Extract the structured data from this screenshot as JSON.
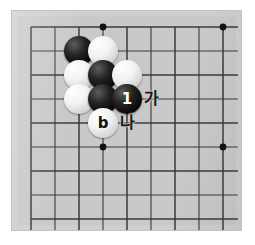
{
  "diagram": {
    "kind": "go-board-diagram",
    "board": {
      "background_color": "#c9c9c9",
      "frame_color": "#cfcfcf",
      "line_color": "#3a3a3a",
      "columns": 9,
      "rows": 9,
      "origin_x": 19,
      "origin_y": 16,
      "spacing": 24,
      "star_points": [
        {
          "col": 3,
          "row": 0
        },
        {
          "col": 8,
          "row": 0
        },
        {
          "col": 3,
          "row": 5
        },
        {
          "col": 8,
          "row": 5
        }
      ]
    },
    "stones": [
      {
        "id": "black-upper-left",
        "color": "black",
        "label": "",
        "col": 2,
        "row": 1
      },
      {
        "id": "white-upper-right",
        "color": "white",
        "label": "",
        "col": 3,
        "row": 1
      },
      {
        "id": "white-left-middle",
        "color": "white",
        "label": "",
        "col": 2,
        "row": 2
      },
      {
        "id": "black-center",
        "color": "black",
        "label": "",
        "col": 3,
        "row": 2
      },
      {
        "id": "white-right-middle",
        "color": "white",
        "label": "",
        "col": 4,
        "row": 2
      },
      {
        "id": "white-left-lower",
        "color": "white",
        "label": "",
        "col": 2,
        "row": 3
      },
      {
        "id": "black-lower-center",
        "color": "black",
        "label": "",
        "col": 3,
        "row": 3
      },
      {
        "id": "black-move-one",
        "color": "black",
        "label": "1",
        "col": 4,
        "row": 3
      },
      {
        "id": "white-marked-b",
        "color": "white",
        "label": "b",
        "col": 3,
        "row": 4
      }
    ],
    "point_labels": [
      {
        "id": "label-ga",
        "text": "가",
        "col": 5,
        "row": 3
      },
      {
        "id": "label-na",
        "text": "나",
        "col": 4,
        "row": 4
      }
    ]
  }
}
